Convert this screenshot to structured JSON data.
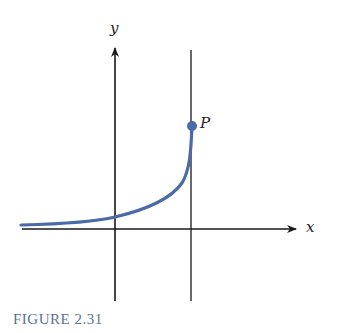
{
  "figure": {
    "caption": "FIGURE 2.31",
    "x_axis_label": "x",
    "y_axis_label": "y",
    "point_label": "P",
    "colors": {
      "curve": "#4a6aa8",
      "axes": "#1a1a1a",
      "caption": "#5a7296",
      "point": "#4a6aa8"
    }
  }
}
